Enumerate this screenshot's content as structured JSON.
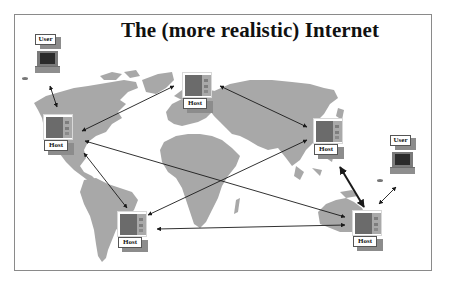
{
  "slide": {
    "title": "The (more realistic) Internet"
  },
  "colors": {
    "land": "#a8a8a8",
    "arrow": "#1a1a1a",
    "frame": "#8a8a8a",
    "host_front": "#6b6b6b",
    "host_side": "#a9a9a9",
    "label_shadow": "#8c8c8c"
  },
  "nodes": {
    "user_top_left": {
      "label": "User",
      "icon": "computer-terminal-icon"
    },
    "user_right": {
      "label": "User",
      "icon": "computer-terminal-icon"
    },
    "host_north_america": {
      "label": "Host",
      "icon": "server-icon"
    },
    "host_europe": {
      "label": "Host",
      "icon": "server-icon"
    },
    "host_asia": {
      "label": "Host",
      "icon": "server-icon"
    },
    "host_south_america": {
      "label": "Host",
      "icon": "server-icon"
    },
    "host_australia": {
      "label": "Host",
      "icon": "server-icon"
    }
  },
  "links": [
    {
      "from": "user_top_left",
      "to": "host_north_america",
      "bidirectional": true
    },
    {
      "from": "host_europe",
      "to": "host_north_america",
      "bidirectional": true
    },
    {
      "from": "host_europe",
      "to": "host_asia",
      "bidirectional": true
    },
    {
      "from": "host_north_america",
      "to": "host_australia",
      "bidirectional": true
    },
    {
      "from": "host_north_america",
      "to": "host_south_america",
      "bidirectional": true
    },
    {
      "from": "host_asia",
      "to": "host_south_america",
      "bidirectional": true
    },
    {
      "from": "host_south_america",
      "to": "host_australia",
      "bidirectional": true
    },
    {
      "from": "host_asia",
      "to": "host_australia",
      "bidirectional": true
    },
    {
      "from": "user_right",
      "to": "host_australia",
      "bidirectional": true
    }
  ]
}
